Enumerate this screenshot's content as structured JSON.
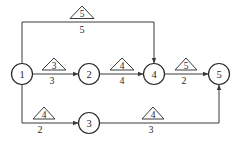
{
  "diagram": {
    "type": "network-diagram",
    "nodes": [
      {
        "id": "1",
        "label": "1",
        "x": 22,
        "y": 74
      },
      {
        "id": "2",
        "label": "2",
        "x": 89,
        "y": 74
      },
      {
        "id": "3",
        "label": "3",
        "x": 89,
        "y": 123
      },
      {
        "id": "4",
        "label": "4",
        "x": 154,
        "y": 74
      },
      {
        "id": "5",
        "label": "5",
        "x": 219,
        "y": 74
      }
    ],
    "edges": [
      {
        "from": "1",
        "to": "4",
        "triangle_label": "5",
        "duration": "5",
        "route": "top"
      },
      {
        "from": "1",
        "to": "2",
        "triangle_label": "3",
        "duration": "3",
        "route": "straight"
      },
      {
        "from": "2",
        "to": "4",
        "triangle_label": "4",
        "duration": "4",
        "route": "straight"
      },
      {
        "from": "4",
        "to": "5",
        "triangle_label": "5",
        "duration": "2",
        "route": "straight"
      },
      {
        "from": "1",
        "to": "3",
        "triangle_label": "4",
        "duration": "2",
        "route": "bottom"
      },
      {
        "from": "3",
        "to": "5",
        "triangle_label": "4",
        "duration": "3",
        "route": "bottom"
      }
    ]
  },
  "colors": {
    "line": "#3a3a3a",
    "text": "#2a2a2a",
    "background": "#ffffff"
  }
}
